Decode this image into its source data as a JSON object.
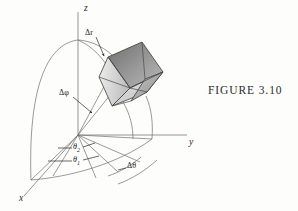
{
  "figure": {
    "caption": "FIGURE  3.10",
    "axes": {
      "z_label": "z",
      "y_label": "y",
      "x_label": "x"
    },
    "annotations": {
      "delta_r": "Δr",
      "delta_phi": "Δφ",
      "theta_2": "θ",
      "theta_2_sub": "2",
      "theta_1": "θ",
      "theta_1_sub": "1",
      "delta_theta": "Δθ"
    },
    "colors": {
      "background": "#fdfdfc",
      "line": "#6e6e6e",
      "axis": "#7a7a7a",
      "text": "#1f1f1f",
      "box_top": "#8d8d8d",
      "box_front": "#d6d6d6",
      "box_right": "#b4b4b4",
      "box_edge": "#3c3c3c"
    }
  }
}
